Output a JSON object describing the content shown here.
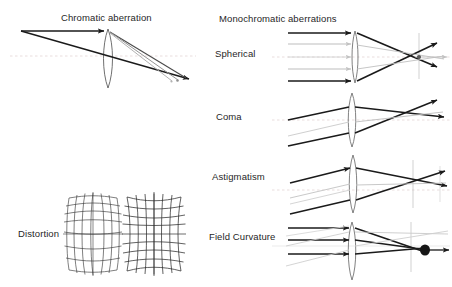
{
  "figure": {
    "kind": "optical-aberrations-diagram",
    "background_color": "#ffffff",
    "ink_color": "#1a1a1a",
    "faint_ray_color": "#b9b9b9",
    "axis_color": "#d9c9c9"
  },
  "titles": {
    "chromatic": "Chromatic aberration",
    "monochromatic": "Monochromatic aberrations"
  },
  "labels": {
    "spherical": "Spherical",
    "coma": "Coma",
    "astigmatism": "Astigmatism",
    "field_curvature": "Field Curvature",
    "distortion": "Distortion"
  },
  "panels": [
    {
      "id": "chromatic-aberration",
      "title": "Chromatic aberration",
      "description": "Two parallel rays entering a thin biconvex lens and focusing at slightly separated points, showing dispersion.",
      "lens": {
        "center_x": 108,
        "center_y": 62,
        "半": 0
      },
      "ray_count": 2,
      "focus_points": 3
    },
    {
      "id": "distortion",
      "title": "Distortion",
      "description": "Two square grids warped: barrel distortion on the left, pincushion distortion on the right.",
      "grids": [
        {
          "type": "barrel",
          "rows": 7,
          "cols": 7
        },
        {
          "type": "pincushion",
          "rows": 7,
          "cols": 7
        }
      ]
    },
    {
      "id": "spherical",
      "title": "Spherical",
      "description": "Parallel rays at different heights crossing the optical axis at different focal distances."
    },
    {
      "id": "coma",
      "title": "Coma",
      "description": "Off-axis parallel rays forming a comet-shaped blur beyond the focal plane."
    },
    {
      "id": "astigmatism",
      "title": "Astigmatism",
      "description": "Tangential and sagittal rays focusing at two separate line foci."
    },
    {
      "id": "field-curvature",
      "title": "Field Curvature",
      "description": "Rays focusing onto a curved image surface rather than a flat image plane."
    }
  ]
}
